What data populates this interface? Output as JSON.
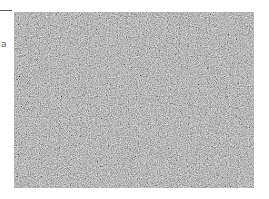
{
  "canvas": {
    "width": 269,
    "height": 199,
    "background": "#ffffff"
  },
  "left_fragment": {
    "rule_color": "#555555",
    "glyph_text": "a"
  },
  "noise_image": {
    "description": "grayscale random noise image",
    "base_color": "#8a8a8a",
    "x": 14,
    "y": 12,
    "width": 240,
    "height": 176
  }
}
